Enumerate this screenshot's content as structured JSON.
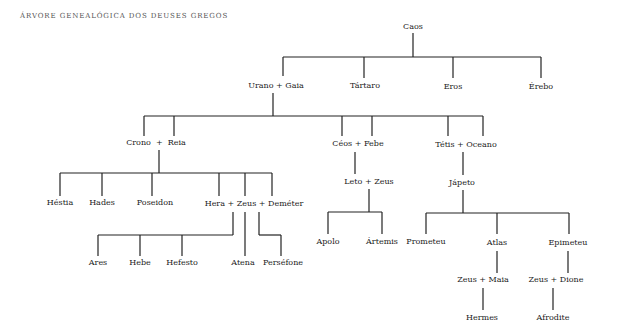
{
  "title": "Árvore genealógica dos deuses gregos",
  "colors": {
    "line": "#222222",
    "text": "#222222",
    "title": "#555555",
    "background": "#ffffff"
  },
  "nodes": [
    {
      "id": "caos",
      "label": "Caos",
      "x": 413,
      "y": 27
    },
    {
      "id": "urano-gaia",
      "label": "Urano + Gaia",
      "x": 276,
      "y": 86
    },
    {
      "id": "tartaro",
      "label": "Tártaro",
      "x": 365,
      "y": 86
    },
    {
      "id": "eros",
      "label": "Eros",
      "x": 453,
      "y": 87
    },
    {
      "id": "erebo",
      "label": "Érebo",
      "x": 541,
      "y": 87
    },
    {
      "id": "crono-reia",
      "label": "Crono  +  Reia",
      "x": 156,
      "y": 143
    },
    {
      "id": "ceos-febe",
      "label": "Céos + Febe",
      "x": 358,
      "y": 144
    },
    {
      "id": "tetis-oceano",
      "label": "Tétis + Oceano",
      "x": 466,
      "y": 145
    },
    {
      "id": "leto-zeus",
      "label": "Leto + Zeus",
      "x": 369,
      "y": 182
    },
    {
      "id": "japeto",
      "label": "Jápeto",
      "x": 462,
      "y": 183
    },
    {
      "id": "hestia",
      "label": "Héstia",
      "x": 60,
      "y": 203
    },
    {
      "id": "hades",
      "label": "Hades",
      "x": 102,
      "y": 203
    },
    {
      "id": "poseidon",
      "label": "Poseidon",
      "x": 155,
      "y": 203
    },
    {
      "id": "hera-zeus-demeter",
      "label": "Hera + Zeus + Deméter",
      "x": 254,
      "y": 204
    },
    {
      "id": "apolo",
      "label": "Apolo",
      "x": 328,
      "y": 242
    },
    {
      "id": "artemis",
      "label": "Ártemis",
      "x": 382,
      "y": 242
    },
    {
      "id": "prometeu",
      "label": "Prometeu",
      "x": 426,
      "y": 242
    },
    {
      "id": "atlas",
      "label": "Atlas",
      "x": 497,
      "y": 243
    },
    {
      "id": "epimeteu",
      "label": "Epimeteu",
      "x": 568,
      "y": 243
    },
    {
      "id": "ares",
      "label": "Ares",
      "x": 98,
      "y": 263
    },
    {
      "id": "hebe",
      "label": "Hebe",
      "x": 140,
      "y": 263
    },
    {
      "id": "hefesto",
      "label": "Hefesto",
      "x": 182,
      "y": 263
    },
    {
      "id": "atena",
      "label": "Atena",
      "x": 243,
      "y": 263
    },
    {
      "id": "persefone",
      "label": "Perséfone",
      "x": 283,
      "y": 263
    },
    {
      "id": "zeus-maia",
      "label": "Zeus + Maia",
      "x": 483,
      "y": 280
    },
    {
      "id": "zeus-dione",
      "label": "Zeus + Dione",
      "x": 556,
      "y": 280
    },
    {
      "id": "hermes",
      "label": "Hermes",
      "x": 482,
      "y": 318
    },
    {
      "id": "afrodite",
      "label": "Afrodite",
      "x": 553,
      "y": 318
    }
  ],
  "lines": [
    [
      413,
      33,
      413,
      57
    ],
    [
      283,
      57,
      541,
      57
    ],
    [
      283,
      57,
      283,
      76
    ],
    [
      364,
      57,
      364,
      78
    ],
    [
      453,
      57,
      453,
      78
    ],
    [
      541,
      57,
      541,
      78
    ],
    [
      273,
      93,
      273,
      116
    ],
    [
      144,
      116,
      483,
      116
    ],
    [
      144,
      116,
      144,
      136
    ],
    [
      174,
      116,
      174,
      136
    ],
    [
      342,
      116,
      342,
      136
    ],
    [
      372,
      116,
      372,
      136
    ],
    [
      448,
      116,
      448,
      136
    ],
    [
      483,
      116,
      483,
      136
    ],
    [
      159,
      150,
      159,
      173
    ],
    [
      60,
      173,
      272,
      173
    ],
    [
      60,
      173,
      60,
      196
    ],
    [
      102,
      173,
      102,
      196
    ],
    [
      152,
      173,
      152,
      196
    ],
    [
      219,
      173,
      219,
      196
    ],
    [
      245,
      173,
      245,
      196
    ],
    [
      272,
      173,
      272,
      196
    ],
    [
      355,
      152,
      355,
      174
    ],
    [
      369,
      189,
      369,
      212
    ],
    [
      328,
      212,
      382,
      212
    ],
    [
      328,
      212,
      328,
      234
    ],
    [
      382,
      212,
      382,
      234
    ],
    [
      463,
      152,
      463,
      175
    ],
    [
      463,
      190,
      463,
      213
    ],
    [
      426,
      213,
      569,
      213
    ],
    [
      426,
      213,
      426,
      234
    ],
    [
      497,
      213,
      497,
      234
    ],
    [
      569,
      213,
      569,
      234
    ],
    [
      233,
      212,
      233,
      235
    ],
    [
      98,
      235,
      233,
      235
    ],
    [
      98,
      235,
      98,
      256
    ],
    [
      140,
      235,
      140,
      256
    ],
    [
      182,
      235,
      182,
      256
    ],
    [
      245,
      212,
      245,
      256
    ],
    [
      259,
      212,
      259,
      235
    ],
    [
      259,
      235,
      281,
      235
    ],
    [
      281,
      235,
      281,
      256
    ],
    [
      497,
      251,
      497,
      273
    ],
    [
      568,
      251,
      568,
      273
    ],
    [
      483,
      288,
      483,
      310
    ],
    [
      553,
      288,
      553,
      310
    ]
  ]
}
